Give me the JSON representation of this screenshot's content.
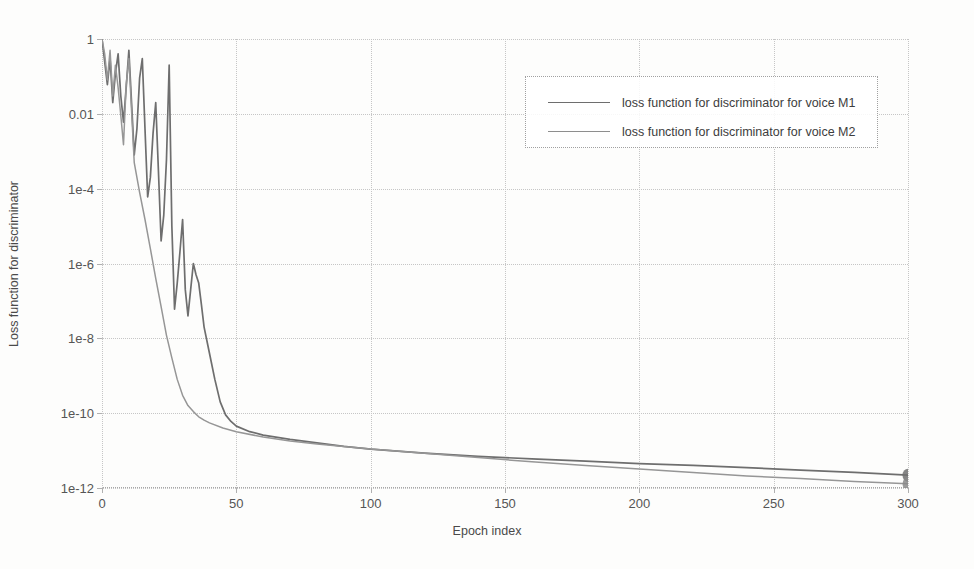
{
  "chart_data": {
    "type": "line",
    "title": "",
    "xlabel": "Epoch index",
    "ylabel": "Loss function for discriminator",
    "xlim": [
      0,
      300
    ],
    "ylim": [
      1e-12,
      1
    ],
    "yscale": "log",
    "grid": true,
    "legend_position": "top-right",
    "xticks": [
      "0",
      "50",
      "100",
      "150",
      "200",
      "250",
      "300"
    ],
    "xtick_values": [
      0,
      50,
      100,
      150,
      200,
      250,
      300
    ],
    "yticks": [
      "1",
      "0.01",
      "1e-4",
      "1e-6",
      "1e-8",
      "1e-10",
      "1e-12"
    ],
    "ytick_values": [
      1,
      0.01,
      0.0001,
      1e-06,
      1e-08,
      1e-10,
      1e-12
    ],
    "series": [
      {
        "name": "loss function for discriminator for voice M1",
        "color": "#6e6e6e",
        "x": [
          0,
          1,
          2,
          3,
          4,
          5,
          6,
          7,
          8,
          9,
          10,
          11,
          12,
          13,
          14,
          15,
          16,
          17,
          18,
          19,
          20,
          21,
          22,
          23,
          24,
          25,
          26,
          27,
          28,
          29,
          30,
          31,
          32,
          33,
          34,
          35,
          36,
          37,
          38,
          40,
          42,
          44,
          46,
          48,
          50,
          55,
          60,
          70,
          80,
          90,
          100,
          120,
          140,
          160,
          180,
          200,
          220,
          240,
          260,
          280,
          300
        ],
        "y": [
          1.0,
          0.25,
          0.06,
          0.3,
          0.02,
          0.12,
          0.4,
          0.03,
          0.006,
          0.05,
          0.5,
          0.02,
          0.0008,
          0.004,
          0.09,
          0.3,
          0.004,
          6e-05,
          0.0002,
          0.003,
          0.02,
          0.0003,
          4e-06,
          2e-05,
          0.0006,
          0.2,
          1e-05,
          6e-08,
          3e-07,
          2e-06,
          1.5e-05,
          2e-07,
          4e-08,
          2e-07,
          1e-06,
          5e-07,
          3e-07,
          8e-08,
          2e-08,
          4e-09,
          8e-10,
          2e-10,
          9e-11,
          6e-11,
          4.5e-11,
          3.2e-11,
          2.6e-11,
          2e-11,
          1.6e-11,
          1.3e-11,
          1.1e-11,
          8.5e-12,
          7e-12,
          6e-12,
          5.2e-12,
          4.5e-12,
          4e-12,
          3.5e-12,
          3e-12,
          2.6e-12,
          2.2e-12
        ]
      },
      {
        "name": "loss function for discriminator for voice M2",
        "color": "#969696",
        "x": [
          0,
          1,
          2,
          3,
          4,
          5,
          6,
          7,
          8,
          9,
          10,
          12,
          14,
          16,
          18,
          20,
          22,
          24,
          26,
          28,
          30,
          32,
          34,
          36,
          38,
          40,
          45,
          50,
          60,
          70,
          80,
          100,
          120,
          140,
          160,
          180,
          200,
          220,
          240,
          260,
          280,
          300
        ],
        "y": [
          1.0,
          0.4,
          0.08,
          0.5,
          0.03,
          0.2,
          0.05,
          0.009,
          0.0015,
          0.06,
          0.3,
          0.0005,
          8e-05,
          1.5e-05,
          2.5e-06,
          4e-07,
          7e-08,
          1.2e-08,
          3e-09,
          8e-10,
          3e-10,
          1.6e-10,
          1.1e-10,
          8e-11,
          6.5e-11,
          5.5e-11,
          4e-11,
          3.2e-11,
          2.3e-11,
          1.8e-11,
          1.5e-11,
          1.1e-11,
          8.5e-12,
          6.5e-12,
          5e-12,
          4e-12,
          3.2e-12,
          2.6e-12,
          2.1e-12,
          1.8e-12,
          1.5e-12,
          1.3e-12
        ]
      }
    ],
    "annotations": [
      {
        "type": "endpoint-marker",
        "x": 300,
        "note": "both curves converge at a dark marker blob at epoch 300"
      }
    ]
  },
  "legend": {
    "items": [
      {
        "label": "loss function for discriminator for voice M1",
        "color": "#6e6e6e"
      },
      {
        "label": "loss function for discriminator for voice M2",
        "color": "#969696"
      }
    ]
  },
  "axes": {
    "x_title": "Epoch index",
    "y_title": "Loss function for discriminator",
    "x_ticks": [
      "0",
      "50",
      "100",
      "150",
      "200",
      "250",
      "300"
    ],
    "y_ticks": [
      "1",
      "0.01",
      "1e-4",
      "1e-6",
      "1e-8",
      "1e-10",
      "1e-12"
    ]
  },
  "page": {
    "caption_sliver": ""
  }
}
